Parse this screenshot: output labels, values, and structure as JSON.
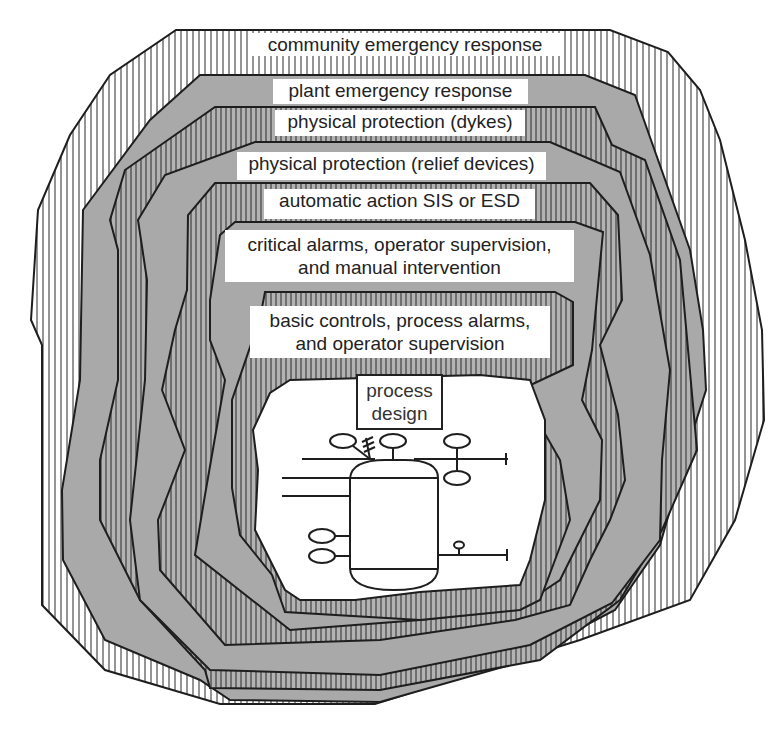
{
  "diagram": {
    "type": "nested-layers-of-protection",
    "colors": {
      "outline": "#1e1e1e",
      "gray_fill": "#a9a9a9",
      "hatch_light_bg": "#ffffff",
      "hatch_dark_bg": "#b3b3b3",
      "hatch_line": "#2a2a2a",
      "label_bg": "#ffffff",
      "text": "#222222"
    },
    "layers": [
      {
        "order": 1,
        "label": "community emergency response",
        "fill": "hatch-light"
      },
      {
        "order": 2,
        "label": "plant emergency response",
        "fill": "gray"
      },
      {
        "order": 3,
        "label": "physical protection (dykes)",
        "fill": "hatch-dark"
      },
      {
        "order": 4,
        "label": "physical protection (relief devices)",
        "fill": "gray"
      },
      {
        "order": 5,
        "label": "automatic action SIS or ESD",
        "fill": "hatch-dark"
      },
      {
        "order": 6,
        "label_line1": "critical alarms, operator supervision,",
        "label_line2": "and manual intervention",
        "fill": "gray"
      },
      {
        "order": 7,
        "label_line1": "basic controls, process alarms,",
        "label_line2": "and operator supervision",
        "fill": "hatch-dark"
      },
      {
        "order": 8,
        "label_line1": "process",
        "label_line2": "design",
        "fill": "white"
      }
    ],
    "core": {
      "title_line1": "process",
      "title_line2": "design",
      "drawing": "process-vessel-schematic"
    }
  }
}
